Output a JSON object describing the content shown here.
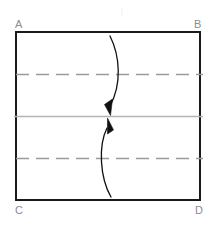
{
  "diagram": {
    "labels": {
      "top_left": "A",
      "top_right": "B",
      "bottom_left": "C",
      "bottom_right": "D"
    },
    "colors": {
      "outline": "#1a1a1a",
      "dashed_fold": "#9a9a9a",
      "center_line": "#b4b4b4",
      "arrow": "#111111",
      "label_text": "#8c8c8c",
      "background": "#ffffff"
    },
    "sheet": {
      "left": 16,
      "top": 32,
      "right": 200,
      "bottom": 200,
      "width": 184,
      "height": 168,
      "stroke_width": 1.6
    },
    "fold_lines": [
      {
        "name": "upper-dashed-fold",
        "style": "dashed",
        "y": 74
      },
      {
        "name": "center-solid-line",
        "style": "solid",
        "y": 116
      },
      {
        "name": "lower-dashed-fold",
        "style": "dashed",
        "y": 158
      }
    ],
    "dash_pattern": "13 7",
    "arrows": [
      {
        "name": "upper-fold-arrow",
        "direction": "down",
        "start_x": 110,
        "start_y": 36,
        "end_x": 108,
        "end_y": 113
      },
      {
        "name": "lower-fold-arrow",
        "direction": "up",
        "start_x": 111,
        "start_y": 197,
        "end_x": 107,
        "end_y": 120
      }
    ]
  }
}
